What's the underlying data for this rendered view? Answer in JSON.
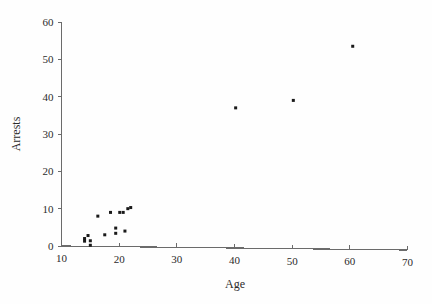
{
  "chart_data": {
    "type": "scatter",
    "title": "",
    "xlabel": "Age",
    "ylabel": "Arrests",
    "xlim": [
      10,
      70
    ],
    "ylim": [
      0,
      60
    ],
    "xticks": [
      10,
      20,
      30,
      40,
      50,
      60,
      70
    ],
    "yticks": [
      0,
      10,
      20,
      30,
      40,
      50,
      60
    ],
    "xtick_labels": [
      "10",
      "20",
      "30",
      "40",
      "50",
      "60",
      "70"
    ],
    "ytick_labels": [
      "0",
      "10",
      "20",
      "30",
      "40",
      "50",
      "60"
    ],
    "grid": false,
    "legend": null,
    "marker": "square",
    "marker_color": "#1a1a1a",
    "marker_size": 3,
    "axis_color": "#6b6b6b",
    "points": [
      {
        "x": 14.0,
        "y": 2.0
      },
      {
        "x": 14.0,
        "y": 1.3
      },
      {
        "x": 14.6,
        "y": 2.8
      },
      {
        "x": 15.0,
        "y": 1.4
      },
      {
        "x": 15.0,
        "y": 0.2
      },
      {
        "x": 16.3,
        "y": 8.0
      },
      {
        "x": 17.5,
        "y": 3.0
      },
      {
        "x": 18.5,
        "y": 9.0
      },
      {
        "x": 19.4,
        "y": 4.8
      },
      {
        "x": 19.4,
        "y": 3.4
      },
      {
        "x": 20.1,
        "y": 9.0
      },
      {
        "x": 20.7,
        "y": 9.0
      },
      {
        "x": 21.0,
        "y": 4.0
      },
      {
        "x": 21.5,
        "y": 10.0
      },
      {
        "x": 22.0,
        "y": 10.3
      },
      {
        "x": 40.2,
        "y": 37.0
      },
      {
        "x": 50.2,
        "y": 39.0
      },
      {
        "x": 60.5,
        "y": 53.5
      }
    ],
    "series": [
      {
        "name": "Arrests by Age",
        "x": [
          14.0,
          14.0,
          14.6,
          15.0,
          15.0,
          16.3,
          17.5,
          18.5,
          19.4,
          19.4,
          20.1,
          20.7,
          21.0,
          21.5,
          22.0,
          40.2,
          50.2,
          60.5
        ],
        "values": [
          2.0,
          1.3,
          2.8,
          1.4,
          0.2,
          8.0,
          3.0,
          9.0,
          4.8,
          3.4,
          9.0,
          9.0,
          4.0,
          10.0,
          10.3,
          37.0,
          39.0,
          53.5
        ]
      }
    ]
  }
}
